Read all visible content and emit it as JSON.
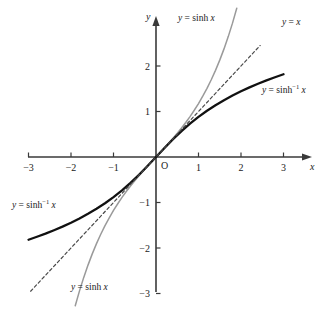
{
  "figure": {
    "title": "",
    "origin_label": "O",
    "x_axis_name": "x",
    "y_axis_name": "y"
  },
  "annotations": [
    {
      "id": "sinh-top",
      "text_parts": {
        "lhs": "y",
        "eq": "=",
        "fn": "sinh",
        "sup": "",
        "arg": "x"
      },
      "plain": "y = sinh x",
      "x": 178,
      "y": 14
    },
    {
      "id": "identity",
      "text_parts": {
        "lhs": "y",
        "eq": "=",
        "fn": "",
        "sup": "",
        "arg": "x"
      },
      "plain": "y = x",
      "x": 282,
      "y": 18
    },
    {
      "id": "asinh-right",
      "text_parts": {
        "lhs": "y",
        "eq": "=",
        "fn": "sinh",
        "sup": "-1",
        "arg": "x"
      },
      "plain": "y = sinh-1 x",
      "x": 262,
      "y": 86
    },
    {
      "id": "asinh-left",
      "text_parts": {
        "lhs": "y",
        "eq": "=",
        "fn": "sinh",
        "sup": "-1",
        "arg": "x"
      },
      "plain": "y = sinh-1 x",
      "x": 12,
      "y": 201
    },
    {
      "id": "sinh-bottom",
      "text_parts": {
        "lhs": "y",
        "eq": "=",
        "fn": "sinh",
        "sup": "",
        "arg": "x"
      },
      "plain": "y = sinh x",
      "x": 71,
      "y": 283
    }
  ],
  "chart_data": {
    "type": "line",
    "title": "",
    "xlabel": "x",
    "ylabel": "y",
    "xlim": [
      -3.2,
      3.2
    ],
    "ylim": [
      -3.1,
      2.45
    ],
    "grid": false,
    "legend": "inline-annotations",
    "xticks": [
      -3,
      -2,
      -1,
      1,
      2,
      3
    ],
    "xtick_labels": [
      "-3",
      "-2",
      "-1",
      "1",
      "2",
      "3"
    ],
    "yticks": [
      2,
      1,
      -1,
      -2,
      -3
    ],
    "ytick_labels": [
      "2",
      "1",
      "-1",
      "-2",
      "-3"
    ],
    "origin_tick_label": "O",
    "series": [
      {
        "name": "y = sinh x",
        "style": "solid-light",
        "color": "#9a9a9a",
        "x": [
          -1.9,
          -1.8,
          -1.7,
          -1.6,
          -1.5,
          -1.4,
          -1.3,
          -1.2,
          -1.1,
          -1.0,
          -0.9,
          -0.8,
          -0.7,
          -0.6,
          -0.5,
          -0.4,
          -0.3,
          -0.2,
          -0.1,
          0.0,
          0.1,
          0.2,
          0.3,
          0.4,
          0.5,
          0.6,
          0.7,
          0.8,
          0.9,
          1.0,
          1.1,
          1.2,
          1.3,
          1.4,
          1.5,
          1.6,
          1.7,
          1.8,
          1.9
        ],
        "values": [
          -3.268,
          -2.942,
          -2.646,
          -2.376,
          -2.129,
          -1.904,
          -1.698,
          -1.509,
          -1.336,
          -1.175,
          -1.027,
          -0.888,
          -0.759,
          -0.637,
          -0.521,
          -0.411,
          -0.305,
          -0.201,
          -0.1,
          0.0,
          0.1,
          0.201,
          0.305,
          0.411,
          0.521,
          0.637,
          0.759,
          0.888,
          1.027,
          1.175,
          1.336,
          1.509,
          1.698,
          1.904,
          2.129,
          2.376,
          2.646,
          2.942,
          3.268
        ]
      },
      {
        "name": "y = sinh-1 x",
        "style": "solid-bold",
        "color": "#111111",
        "x": [
          -3.0,
          -2.8,
          -2.6,
          -2.4,
          -2.2,
          -2.0,
          -1.8,
          -1.6,
          -1.4,
          -1.2,
          -1.0,
          -0.8,
          -0.6,
          -0.4,
          -0.2,
          0.0,
          0.2,
          0.4,
          0.6,
          0.8,
          1.0,
          1.2,
          1.4,
          1.6,
          1.8,
          2.0,
          2.2,
          2.4,
          2.6,
          2.8,
          3.0
        ],
        "values": [
          -1.818,
          -1.753,
          -1.684,
          -1.609,
          -1.53,
          -1.444,
          -1.35,
          -1.248,
          -1.137,
          -1.016,
          -0.881,
          -0.733,
          -0.569,
          -0.39,
          -0.199,
          0.0,
          0.199,
          0.39,
          0.569,
          0.733,
          0.881,
          1.016,
          1.137,
          1.248,
          1.35,
          1.444,
          1.53,
          1.609,
          1.684,
          1.753,
          1.818
        ]
      },
      {
        "name": "y = x",
        "style": "dashed",
        "color": "#4a4a4a",
        "x": [
          -2.95,
          2.45
        ],
        "values": [
          -2.95,
          2.45
        ]
      }
    ]
  },
  "geometry": {
    "origin_px": {
      "x": 156,
      "y": 157
    },
    "unit_px": {
      "x": 42.5,
      "y": 45.5
    },
    "x_axis_px": {
      "x1": 28,
      "x2": 306
    },
    "y_axis_px": {
      "y1": 22,
      "y2": 292
    }
  }
}
